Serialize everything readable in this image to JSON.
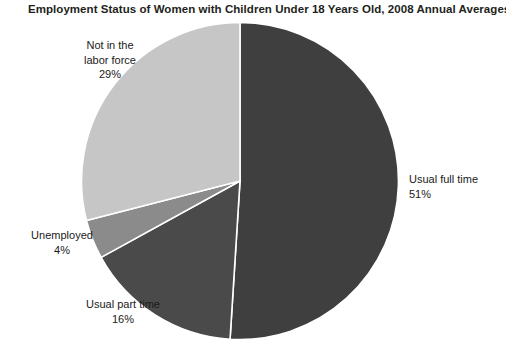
{
  "chart_data": {
    "type": "pie",
    "title": "Employment Status of Women with Children Under 18 Years Old, 2008 Annual Averages",
    "categories": [
      "Usual full time",
      "Usual part time",
      "Unemployed",
      "Not in the labor force"
    ],
    "values": [
      51,
      16,
      4,
      29
    ],
    "value_suffix": "%",
    "labels": [
      {
        "name": "Usual full time",
        "value": 51,
        "value_text": "51%",
        "color": "#3f3f3f",
        "position": "right"
      },
      {
        "name": "Usual part time",
        "value": 16,
        "value_text": "16%",
        "color": "#4a4a4a",
        "position": "bottom-left"
      },
      {
        "name": "Unemployed",
        "value": 4,
        "value_text": "4%",
        "color": "#8b8b8b",
        "position": "left"
      },
      {
        "name": "Not in the labor force",
        "value": 29,
        "value_text": "29%",
        "color": "#c6c6c6",
        "position": "top-left"
      }
    ],
    "start_angle_deg": 0,
    "direction": "clockwise",
    "legend": "none",
    "grid": false,
    "xlabel": "",
    "ylabel": "",
    "slice_border_color": "#ffffff",
    "background_color": "#ffffff"
  },
  "labels": {
    "not_in_labor_force_line1": "Not in the",
    "not_in_labor_force_line2": "labor force",
    "not_in_labor_force_pct": "29%",
    "full_time_name": "Usual full time",
    "full_time_pct": "51%",
    "unemployed_name": "Unemployed",
    "unemployed_pct": "4%",
    "part_time_name": "Usual part time",
    "part_time_pct": "16%"
  }
}
